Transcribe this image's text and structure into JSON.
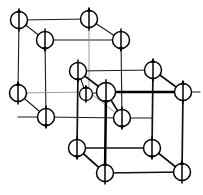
{
  "figure": {
    "background_color": "#ffffff",
    "line_color": "#000000",
    "faint_line_color": "#9a9a9a",
    "site_fill_color": "#ffffff",
    "width": 203,
    "height": 195
  },
  "legend": {
    "up_label": "spin up",
    "down_label": "spin down"
  },
  "lattice": {
    "back_cube_label": "back sublattice cube",
    "front_cube_label": "front sublattice cube",
    "back_cube_line_weight": "thin",
    "front_cube_line_weight": "thick"
  },
  "sites": [
    {
      "id": "s1",
      "x": 19,
      "y": 20,
      "r": 8.5,
      "spin": "up",
      "name": "site-back-top-back-left"
    },
    {
      "id": "s2",
      "x": 89,
      "y": 19,
      "r": 8.5,
      "spin": "up",
      "name": "site-back-top-back-right"
    },
    {
      "id": "s3",
      "x": 45,
      "y": 40,
      "r": 8.5,
      "spin": "down",
      "name": "site-back-top-front-left"
    },
    {
      "id": "s4",
      "x": 121,
      "y": 40,
      "r": 8.5,
      "spin": "down",
      "name": "site-back-top-front-right"
    },
    {
      "id": "s5",
      "x": 18,
      "y": 93,
      "r": 8.5,
      "spin": "up",
      "name": "site-back-bottom-back-left"
    },
    {
      "id": "s6",
      "x": 46,
      "y": 117,
      "r": 8.5,
      "spin": "down",
      "name": "site-back-bottom-front-left"
    },
    {
      "id": "s7",
      "x": 78,
      "y": 71,
      "r": 8.5,
      "spin": "down",
      "name": "site-front-top-back-left"
    },
    {
      "id": "s8",
      "x": 153,
      "y": 70,
      "r": 8.5,
      "spin": "up",
      "name": "site-front-top-back-right"
    },
    {
      "id": "s9",
      "x": 106,
      "y": 92,
      "r": 9.5,
      "spin": "down",
      "name": "site-front-top-front-left"
    },
    {
      "id": "s10",
      "x": 86,
      "y": 94,
      "r": 6.5,
      "spin": "up",
      "name": "site-interstitial-center-left"
    },
    {
      "id": "s11",
      "x": 122,
      "y": 118,
      "r": 8.5,
      "spin": "down",
      "name": "site-front-mid-front"
    },
    {
      "id": "s12",
      "x": 183,
      "y": 92,
      "r": 8.5,
      "spin": "up",
      "name": "site-front-top-front-right"
    },
    {
      "id": "s13",
      "x": 77,
      "y": 148,
      "r": 8.5,
      "spin": "down",
      "name": "site-front-bottom-back-left"
    },
    {
      "id": "s14",
      "x": 152,
      "y": 148,
      "r": 8.5,
      "spin": "down",
      "name": "site-front-bottom-back-right"
    },
    {
      "id": "s15",
      "x": 105,
      "y": 173,
      "r": 8.5,
      "spin": "up",
      "name": "site-front-bottom-front-left"
    },
    {
      "id": "s16",
      "x": 182,
      "y": 172,
      "r": 8.5,
      "spin": "up",
      "name": "site-front-bottom-front-right"
    }
  ],
  "edges": [
    {
      "x1": 19,
      "y1": 20,
      "x2": 89,
      "y2": 19,
      "weight": "thin",
      "name": "edge-back-top-back"
    },
    {
      "x1": 19,
      "y1": 20,
      "x2": 45,
      "y2": 40,
      "weight": "thin",
      "name": "edge-back-top-left-diag"
    },
    {
      "x1": 89,
      "y1": 19,
      "x2": 121,
      "y2": 40,
      "weight": "thin",
      "name": "edge-back-top-right-diag"
    },
    {
      "x1": 45,
      "y1": 40,
      "x2": 121,
      "y2": 40,
      "weight": "thin",
      "name": "edge-back-top-front"
    },
    {
      "x1": 19,
      "y1": 20,
      "x2": 18,
      "y2": 93,
      "weight": "thin",
      "name": "edge-back-left-back-vert"
    },
    {
      "x1": 89,
      "y1": 19,
      "x2": 89,
      "y2": 92,
      "weight": "faint",
      "name": "edge-back-right-back-vert"
    },
    {
      "x1": 45,
      "y1": 40,
      "x2": 46,
      "y2": 117,
      "weight": "thin",
      "name": "edge-back-left-front-vert"
    },
    {
      "x1": 121,
      "y1": 40,
      "x2": 122,
      "y2": 118,
      "weight": "thin",
      "name": "edge-back-right-front-vert"
    },
    {
      "x1": 18,
      "y1": 93,
      "x2": 89,
      "y2": 92,
      "weight": "faint",
      "name": "edge-back-bottom-back"
    },
    {
      "x1": 18,
      "y1": 93,
      "x2": 46,
      "y2": 117,
      "weight": "thin",
      "name": "edge-back-bottom-left-diag"
    },
    {
      "x1": 46,
      "y1": 117,
      "x2": 122,
      "y2": 118,
      "weight": "thin",
      "name": "edge-back-bottom-front"
    },
    {
      "x1": 89,
      "y1": 92,
      "x2": 122,
      "y2": 118,
      "weight": "faint",
      "name": "edge-back-bottom-right-diag"
    },
    {
      "x1": 78,
      "y1": 71,
      "x2": 153,
      "y2": 70,
      "weight": "thin",
      "name": "edge-front-top-back"
    },
    {
      "x1": 78,
      "y1": 71,
      "x2": 106,
      "y2": 92,
      "weight": "med",
      "name": "edge-front-top-left-diag"
    },
    {
      "x1": 153,
      "y1": 70,
      "x2": 183,
      "y2": 92,
      "weight": "med",
      "name": "edge-front-top-right-diag"
    },
    {
      "x1": 106,
      "y1": 92,
      "x2": 183,
      "y2": 92,
      "weight": "thick",
      "name": "edge-front-top-front"
    },
    {
      "x1": 78,
      "y1": 71,
      "x2": 77,
      "y2": 148,
      "weight": "med",
      "name": "edge-front-left-back-vert"
    },
    {
      "x1": 153,
      "y1": 70,
      "x2": 152,
      "y2": 148,
      "weight": "med",
      "name": "edge-front-right-back-vert"
    },
    {
      "x1": 106,
      "y1": 92,
      "x2": 105,
      "y2": 173,
      "weight": "thick",
      "name": "edge-front-left-front-vert"
    },
    {
      "x1": 183,
      "y1": 92,
      "x2": 182,
      "y2": 172,
      "weight": "med",
      "name": "edge-front-right-front-vert"
    },
    {
      "x1": 77,
      "y1": 148,
      "x2": 152,
      "y2": 148,
      "weight": "med",
      "name": "edge-front-bottom-back"
    },
    {
      "x1": 77,
      "y1": 148,
      "x2": 105,
      "y2": 173,
      "weight": "med",
      "name": "edge-front-bottom-left-diag"
    },
    {
      "x1": 152,
      "y1": 148,
      "x2": 182,
      "y2": 172,
      "weight": "med",
      "name": "edge-front-bottom-right-diag"
    },
    {
      "x1": 105,
      "y1": 173,
      "x2": 182,
      "y2": 172,
      "weight": "med",
      "name": "edge-front-bottom-front"
    },
    {
      "x1": 106,
      "y1": 92,
      "x2": 122,
      "y2": 118,
      "weight": "med",
      "name": "edge-front-center-diag"
    },
    {
      "x1": 86,
      "y1": 94,
      "x2": 106,
      "y2": 92,
      "weight": "thin",
      "name": "edge-interstitial-link"
    },
    {
      "x1": 78,
      "y1": 71,
      "x2": 86,
      "y2": 94,
      "weight": "thin",
      "name": "edge-interstitial-diag"
    },
    {
      "x1": 122,
      "y1": 118,
      "x2": 152,
      "y2": 118,
      "weight": "thin",
      "name": "edge-front-mid-right"
    },
    {
      "x1": 46,
      "y1": 117,
      "x2": 18,
      "y2": 117,
      "weight": "thin",
      "name": "edge-back-bottom-left-stub"
    },
    {
      "x1": 183,
      "y1": 92,
      "x2": 200,
      "y2": 92,
      "weight": "thin",
      "name": "edge-front-right-stub"
    }
  ]
}
